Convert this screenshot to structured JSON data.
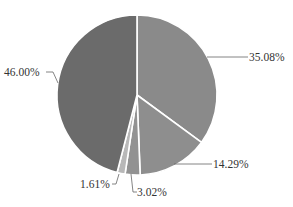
{
  "chart_data": {
    "type": "pie",
    "title": "",
    "start_angle_deg": 0,
    "direction": "clockwise",
    "slices": [
      {
        "label": "35.08%",
        "value": 35.08,
        "color": "#8a8a8a"
      },
      {
        "label": "14.29%",
        "value": 14.29,
        "color": "#8e8e8e"
      },
      {
        "label": "3.02%",
        "value": 3.02,
        "color": "#929292"
      },
      {
        "label": "1.61%",
        "value": 1.61,
        "color": "#b8b8b8"
      },
      {
        "label": "46.00%",
        "value": 46.0,
        "color": "#6b6b6b"
      }
    ],
    "legend": "none",
    "data_labels": "percent, outside with leader lines"
  },
  "labels": {
    "s0": "35.08%",
    "s1": "14.29%",
    "s2": "3.02%",
    "s3": "1.61%",
    "s4": "46.00%"
  }
}
